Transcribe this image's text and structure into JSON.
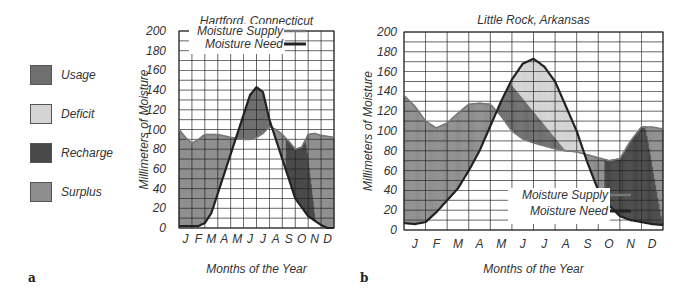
{
  "legend": {
    "items": [
      {
        "label": "Usage",
        "color": "#6f6f6f"
      },
      {
        "label": "Deficit",
        "color": "#d4d4d4"
      },
      {
        "label": "Recharge",
        "color": "#484848"
      },
      {
        "label": "Surplus",
        "color": "#8e8e8e"
      }
    ]
  },
  "panels": {
    "a": {
      "label": "a"
    },
    "b": {
      "label": "b"
    }
  },
  "chart_data": [
    {
      "type": "area",
      "title": "Hartford, Connecticut",
      "xlabel": "Months of the Year",
      "ylabel": "Millimeters of Moisture",
      "categories": [
        "J",
        "F",
        "M",
        "A",
        "M",
        "J",
        "J",
        "A",
        "S",
        "O",
        "N",
        "D"
      ],
      "yticks": [
        0,
        20,
        40,
        60,
        80,
        100,
        120,
        140,
        160,
        180,
        200
      ],
      "ylim": [
        0,
        200
      ],
      "grid": true,
      "legend_position": "top-center",
      "legend_entries": [
        "Moisture Supply",
        "Moisture Need"
      ],
      "series": [
        {
          "name": "Moisture Supply",
          "x": [
            0,
            0.5,
            1,
            1.5,
            2,
            3,
            4,
            5,
            5.5,
            6,
            6.5,
            7,
            7.5,
            8,
            8.5,
            9,
            9.5,
            10,
            10.5,
            11,
            11.5,
            12
          ],
          "values": [
            100,
            92,
            86,
            90,
            95,
            95,
            92,
            90,
            90,
            92,
            96,
            103,
            100,
            95,
            88,
            80,
            82,
            95,
            96,
            94,
            93,
            92
          ]
        },
        {
          "name": "Moisture Need",
          "x": [
            0,
            1,
            1.5,
            2,
            2.5,
            3,
            4,
            5,
            5.5,
            6,
            6.5,
            7,
            7.5,
            8,
            8.5,
            9,
            10,
            11,
            11.5,
            12
          ],
          "values": [
            2,
            2,
            2,
            5,
            15,
            35,
            75,
            115,
            135,
            143,
            138,
            110,
            90,
            70,
            50,
            30,
            12,
            3,
            0,
            0
          ]
        }
      ],
      "regions": [
        "Surplus (Jan–Apr, Nov–Dec)",
        "Usage (Jun–Aug)",
        "Recharge (Sep–Nov)"
      ]
    },
    {
      "type": "area",
      "title": "Little Rock, Arkansas",
      "xlabel": "Months of the Year",
      "ylabel": "Millimeters of Moisture",
      "categories": [
        "J",
        "F",
        "M",
        "A",
        "M",
        "J",
        "J",
        "A",
        "S",
        "O",
        "N",
        "D"
      ],
      "yticks": [
        0,
        20,
        40,
        60,
        80,
        100,
        120,
        140,
        160,
        180,
        200
      ],
      "ylim": [
        0,
        200
      ],
      "grid": true,
      "legend_position": "bottom-right",
      "legend_entries": [
        "Moisture Supply",
        "Moisture Need"
      ],
      "series": [
        {
          "name": "Moisture Supply",
          "x": [
            0,
            0.5,
            1,
            1.5,
            2,
            2.5,
            3,
            3.5,
            4,
            4.5,
            5,
            5.5,
            6,
            6.5,
            7,
            7.5,
            8,
            8.5,
            9,
            9.5,
            10,
            10.5,
            11,
            11.5,
            12
          ],
          "values": [
            136,
            125,
            110,
            103,
            108,
            118,
            127,
            128,
            127,
            115,
            100,
            92,
            88,
            85,
            82,
            80,
            79,
            76,
            73,
            70,
            72,
            90,
            104,
            104,
            102
          ]
        },
        {
          "name": "Moisture Need",
          "x": [
            0,
            0.5,
            1,
            1.5,
            2,
            2.5,
            3,
            3.5,
            4,
            4.5,
            5,
            5.5,
            6,
            6.5,
            7,
            7.5,
            8,
            8.5,
            9,
            9.5,
            10,
            10.5,
            11,
            11.5,
            12
          ],
          "values": [
            7,
            6,
            8,
            18,
            30,
            42,
            60,
            80,
            105,
            130,
            152,
            168,
            173,
            165,
            150,
            125,
            100,
            68,
            40,
            25,
            14,
            10,
            8,
            6,
            5
          ]
        }
      ],
      "regions": [
        "Surplus (Jan–Apr, Dec)",
        "Usage (May–Jul)",
        "Deficit (Jun–Sep)",
        "Recharge (Oct–Dec)"
      ]
    }
  ]
}
